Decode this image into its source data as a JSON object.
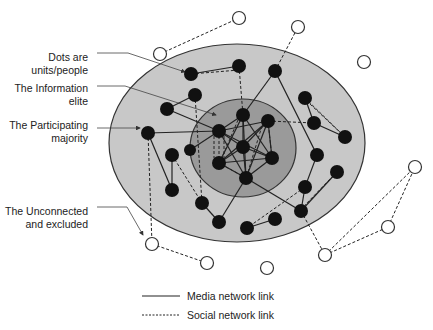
{
  "labels": {
    "dots": [
      "Dots are",
      "units/people"
    ],
    "elite": [
      "The Information",
      "elite"
    ],
    "majority": [
      "The Participating",
      "majority"
    ],
    "unconnected": [
      "The Unconnected",
      "and excluded"
    ]
  },
  "legend": {
    "media": "Media network link",
    "social": "Social network link"
  },
  "colors": {
    "outer_ring": "#c8c8c8",
    "inner_circle": "#9a9a9a",
    "node_fill": "#111111",
    "line": "#222222"
  }
}
